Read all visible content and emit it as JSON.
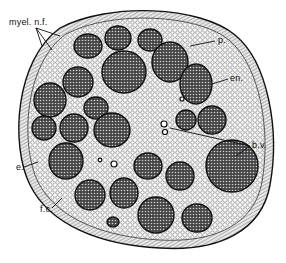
{
  "figure": {
    "labels": [
      {
        "id": "myel",
        "text": "myel. n.f.",
        "x": 9,
        "y": 18
      },
      {
        "id": "p",
        "text": "p.",
        "x": 218,
        "y": 36
      },
      {
        "id": "en",
        "text": "en.",
        "x": 230,
        "y": 74
      },
      {
        "id": "bv",
        "text": "b.v.",
        "x": 252,
        "y": 141
      },
      {
        "id": "e",
        "text": "e.",
        "x": 16,
        "y": 163
      },
      {
        "id": "fc",
        "text": "f.c.",
        "x": 40,
        "y": 205
      }
    ],
    "colors": {
      "ink": "#111111",
      "paper": "#ffffff",
      "fascicle": "#3a3a3a",
      "stroma": "#f2f2f2"
    }
  }
}
